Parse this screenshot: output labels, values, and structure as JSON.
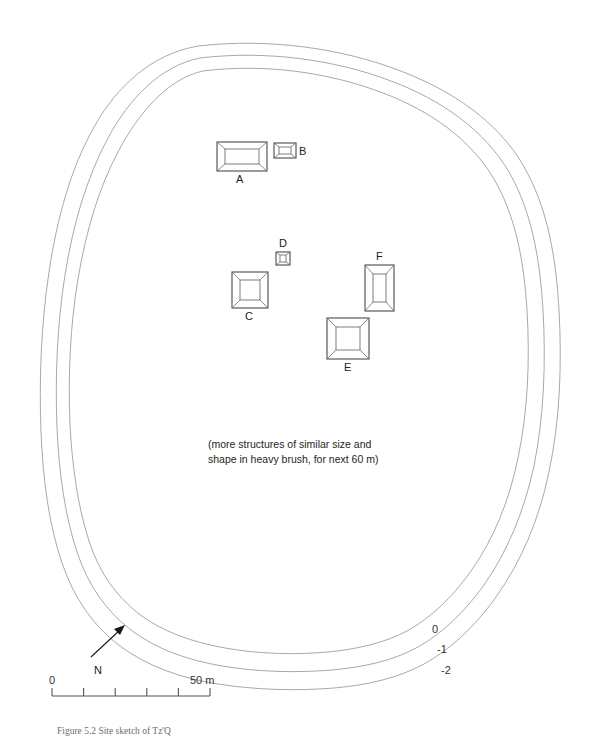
{
  "figure": {
    "caption": "Figure 5.2 Site sketch of Tz'Q",
    "note_line_1": "(more structures of similar size and",
    "note_line_2": "shape in heavy brush, for next 60 m)"
  },
  "structures": [
    {
      "id": "A",
      "label": "A",
      "shape": "rectangle-horizontal",
      "x": 217,
      "y": 142,
      "width": 50,
      "height": 29,
      "label_position": "below"
    },
    {
      "id": "B",
      "label": "B",
      "shape": "rectangle-horizontal",
      "x": 274,
      "y": 143,
      "width": 22,
      "height": 15,
      "label_position": "right"
    },
    {
      "id": "C",
      "label": "C",
      "shape": "square",
      "x": 232,
      "y": 272,
      "width": 36,
      "height": 36,
      "label_position": "below"
    },
    {
      "id": "D",
      "label": "D",
      "shape": "square-small",
      "x": 276,
      "y": 252,
      "width": 14,
      "height": 13,
      "label_position": "above"
    },
    {
      "id": "E",
      "label": "E",
      "shape": "square",
      "x": 327,
      "y": 318,
      "width": 42,
      "height": 41,
      "label_position": "below"
    },
    {
      "id": "F",
      "label": "F",
      "shape": "rectangle-vertical",
      "x": 365,
      "y": 265,
      "width": 29,
      "height": 46,
      "label_position": "above"
    }
  ],
  "contours": [
    {
      "label": "0",
      "value": 0,
      "label_x": 432,
      "label_y": 629
    },
    {
      "label": "-1",
      "value": -1,
      "label_x": 437,
      "label_y": 649
    },
    {
      "label": "-2",
      "value": -2,
      "label_x": 441,
      "label_y": 670
    }
  ],
  "north_arrow": {
    "label": "N",
    "tail_x": 91,
    "tail_y": 657,
    "tip_x": 124,
    "tip_y": 626,
    "label_x": 94,
    "label_y": 674
  },
  "scale_bar": {
    "start_label": "0",
    "end_label": "50 m",
    "start_value": 0,
    "end_value": 50,
    "units": "m",
    "tick_count": 6,
    "interval_m": 10,
    "x": 52,
    "y": 696,
    "width": 158
  },
  "colors": {
    "contour_line": "#a9a9ac",
    "structure_outline": "#4a4a4a",
    "structure_inner": "#6f6f6f",
    "text": "#231f20",
    "background": "#ffffff"
  }
}
